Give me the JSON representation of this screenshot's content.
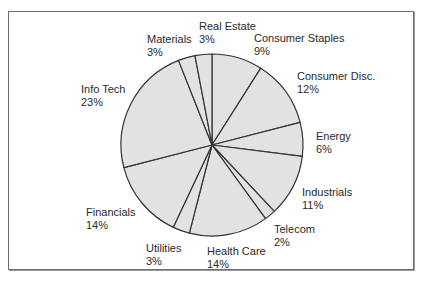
{
  "chart_data": {
    "type": "pie",
    "title": "",
    "start_angle": "12 o'clock",
    "direction": "clockwise",
    "fill_color": "#e2e2e2",
    "stroke_color": "#333333",
    "slices": [
      {
        "label": "Consumer Staples",
        "value": 9,
        "display": "9%"
      },
      {
        "label": "Consumer Disc.",
        "value": 12,
        "display": "12%"
      },
      {
        "label": "Energy",
        "value": 6,
        "display": "6%"
      },
      {
        "label": "Industrials",
        "value": 11,
        "display": "11%"
      },
      {
        "label": "Telecom",
        "value": 2,
        "display": "2%"
      },
      {
        "label": "Health Care",
        "value": 14,
        "display": "14%"
      },
      {
        "label": "Utilities",
        "value": 3,
        "display": "3%"
      },
      {
        "label": "Financials",
        "value": 14,
        "display": "14%"
      },
      {
        "label": "Info Tech",
        "value": 23,
        "display": "23%"
      },
      {
        "label": "Materials",
        "value": 3,
        "display": "3%"
      },
      {
        "label": "Real Estate",
        "value": 3,
        "display": "3%"
      }
    ],
    "categories": [
      "Consumer Staples",
      "Consumer Disc.",
      "Energy",
      "Industrials",
      "Telecom",
      "Health Care",
      "Utilities",
      "Financials",
      "Info Tech",
      "Materials",
      "Real Estate"
    ],
    "values": [
      9,
      12,
      6,
      11,
      2,
      14,
      3,
      14,
      23,
      3,
      3
    ],
    "legend": "none (direct labels)",
    "unit": "%"
  }
}
